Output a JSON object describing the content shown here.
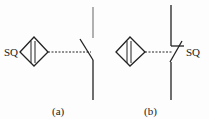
{
  "panels": [
    {
      "id": "a",
      "caption": "(a)",
      "symbol_label": "SQ"
    },
    {
      "id": "b",
      "caption": "(b)",
      "symbol_label": "SQ"
    }
  ],
  "colors": {
    "stroke": "#222222",
    "background": "#fdfdfd"
  }
}
